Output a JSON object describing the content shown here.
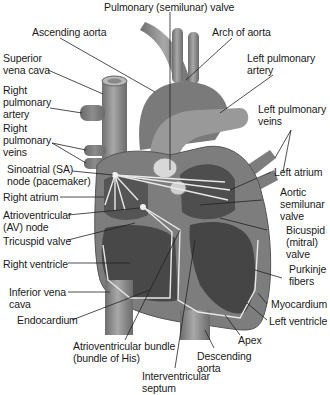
{
  "diagram": {
    "labels": {
      "pulmonary_valve": "Pulmonary (semilunar) valve",
      "ascending_aorta": "Ascending aorta",
      "arch_of_aorta": "Arch of aorta",
      "superior_vena_cava": "Superior\nvena cava",
      "left_pulmonary_artery": "Left pulmonary\nartery",
      "right_pulmonary_artery": "Right\npulmonary\nartery",
      "left_pulmonary_veins": "Left pulmonary\nveins",
      "right_pulmonary_veins": "Right\npulmonary\nveins",
      "sa_node": "Sinoatrial (SA)\nnode (pacemaker)",
      "left_atrium": "Left atrium",
      "right_atrium": "Right atrium",
      "aortic_valve": "Aortic\nsemilunar\nvalve",
      "av_node": "Atrioventricular\n(AV) node",
      "bicuspid_valve": "Bicuspid\n(mitral)\nvalve",
      "tricuspid_valve": "Tricuspid valve",
      "right_ventricle": "Right ventricle",
      "purkinje_fibers": "Purkinje\nfibers",
      "inferior_vena_cava": "Inferior vena\ncava",
      "myocardium": "Myocardium",
      "endocardium": "Endocardium",
      "left_ventricle": "Left ventricle",
      "apex": "Apex",
      "av_bundle": "Atrioventricular bundle\n(bundle of His)",
      "descending_aorta": "Descending\naorta",
      "interventricular_septum": "Interventricular\nseptum"
    },
    "colors": {
      "background": "#ffffff",
      "heart_wall": "#7d7d7d",
      "chamber": "#4a4a4a",
      "vessel": "#8f8f8f",
      "conduction": "#e6e6e6",
      "leader_line": "#222222"
    }
  }
}
